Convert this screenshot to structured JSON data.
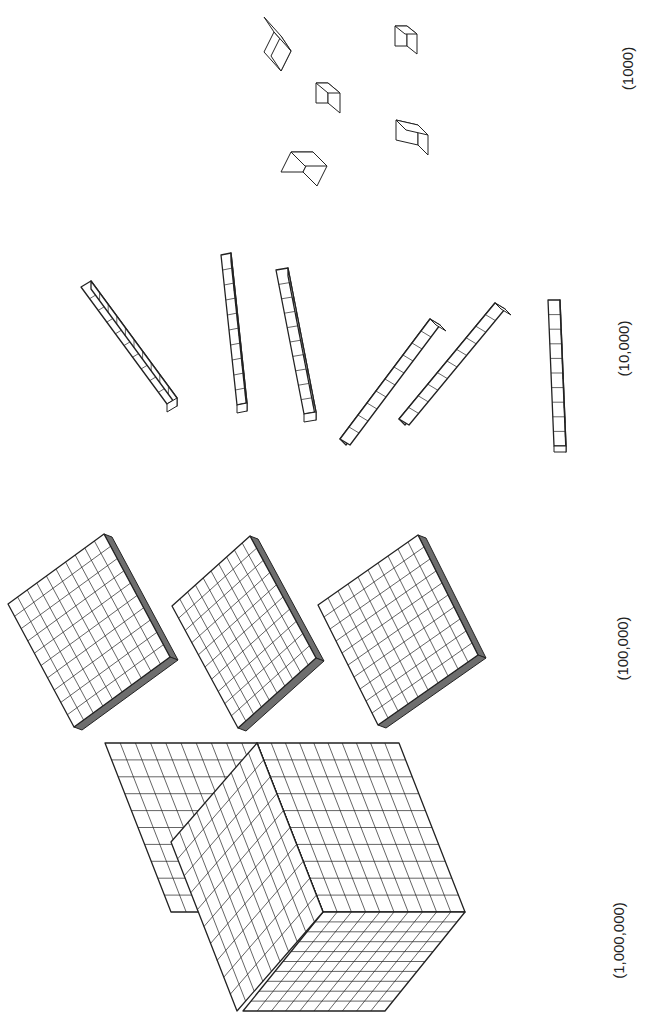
{
  "diagram": {
    "line_color": "#222222",
    "shade_color": "#6e6e6e",
    "groups": [
      {
        "id": "thousands-cubes",
        "label": "(1000)",
        "count": 5
      },
      {
        "id": "ten-thousand-rods",
        "label": "(10,000)",
        "count": 6
      },
      {
        "id": "hundred-thousand-flats",
        "label": "(100,000)",
        "count": 3
      },
      {
        "id": "million-cube",
        "label": "(1,000,000)",
        "count": 1
      }
    ]
  }
}
